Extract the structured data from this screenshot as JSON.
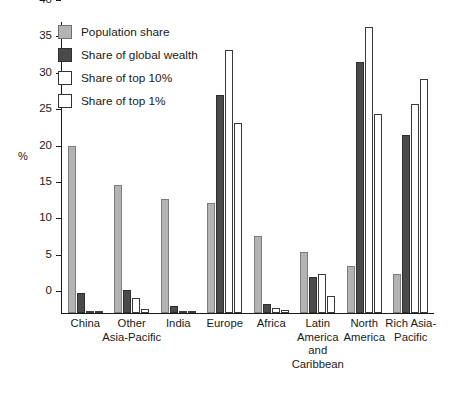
{
  "chart_data": {
    "type": "bar",
    "title": "",
    "xlabel": "",
    "ylabel": "%",
    "ylim": [
      0,
      40
    ],
    "yticks": [
      0,
      5,
      10,
      15,
      20,
      25,
      30,
      35,
      40
    ],
    "grid": false,
    "legend_position": "top-left",
    "categories": [
      "China",
      "Other Asia-Pacific",
      "India",
      "Europe",
      "Africa",
      "Latin America and Caribbean",
      "North America",
      "Rich Asia-Pacific"
    ],
    "category_label_lines": [
      [
        "China"
      ],
      [
        "Other",
        "Asia-Pacific"
      ],
      [
        "India"
      ],
      [
        "Europe"
      ],
      [
        "Africa"
      ],
      [
        "Latin",
        "America",
        "and",
        "Caribbean"
      ],
      [
        "North",
        "America"
      ],
      [
        "Rich Asia-",
        "Pacific"
      ]
    ],
    "series": [
      {
        "name": "Population share",
        "color": "#b3b3b3",
        "values": [
          22.9,
          17.6,
          15.7,
          15.1,
          10.6,
          8.4,
          6.4,
          5.4
        ]
      },
      {
        "name": "Share of global wealth",
        "color": "#4a4a4a",
        "values": [
          2.7,
          3.1,
          0.9,
          29.9,
          1.2,
          4.9,
          34.5,
          24.5
        ]
      },
      {
        "name": "Share of top 10%",
        "color": "#ffffff",
        "values": [
          0.2,
          2.1,
          0.2,
          36.2,
          0.7,
          5.4,
          39.3,
          28.7
        ]
      },
      {
        "name": "Share of top 1%",
        "color": "#ffffff",
        "values": [
          0.1,
          0.6,
          0.1,
          26.1,
          0.4,
          2.4,
          27.3,
          32.1
        ]
      }
    ]
  },
  "legend": {
    "items": [
      {
        "label": "Population share",
        "swatch": "pop"
      },
      {
        "label": "Share of global wealth",
        "swatch": "wealth"
      },
      {
        "label": "Share of top 10%",
        "swatch": "top10"
      },
      {
        "label": "Share of top 1%",
        "swatch": "top1"
      }
    ]
  }
}
